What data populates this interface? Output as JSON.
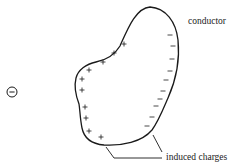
{
  "diagram": {
    "labels": {
      "conductor": "conductor",
      "induced_charges": "induced charges"
    },
    "external_charge": {
      "sign": "−",
      "icon": "negative-charge-icon",
      "cx": 12,
      "cy": 92,
      "r": 5
    },
    "conductor_outline_path": "M150,7 C166,8 176,22 178,40 C180,60 176,80 168,98 C162,112 158,122 152,130 C142,142 122,146 104,145 C92,144 84,138 82,128 C80,118 80,110 79,104 C76,96 74,86 76,78 C78,70 86,64 96,62 C106,60 114,56 120,46 C128,28 136,8 150,7 Z",
    "positive_charges": [
      {
        "x": 124,
        "y": 44
      },
      {
        "x": 114,
        "y": 53
      },
      {
        "x": 103,
        "y": 62
      },
      {
        "x": 89,
        "y": 70
      },
      {
        "x": 82,
        "y": 79
      },
      {
        "x": 82,
        "y": 90
      },
      {
        "x": 85,
        "y": 107
      },
      {
        "x": 86,
        "y": 118
      },
      {
        "x": 89,
        "y": 131
      },
      {
        "x": 101,
        "y": 137
      }
    ],
    "negative_charges": [
      {
        "x": 170,
        "y": 35
      },
      {
        "x": 173,
        "y": 46
      },
      {
        "x": 172,
        "y": 59
      },
      {
        "x": 170,
        "y": 71
      },
      {
        "x": 166,
        "y": 80
      },
      {
        "x": 163,
        "y": 91
      },
      {
        "x": 160,
        "y": 99
      },
      {
        "x": 156,
        "y": 106
      },
      {
        "x": 152,
        "y": 117
      },
      {
        "x": 147,
        "y": 126
      }
    ],
    "leaders": [
      {
        "points": "106,147 114,158 162,158"
      },
      {
        "points": "153,135 162,152"
      }
    ],
    "colors": {
      "stroke": "#1a1a1a",
      "background": "#ffffff"
    }
  }
}
